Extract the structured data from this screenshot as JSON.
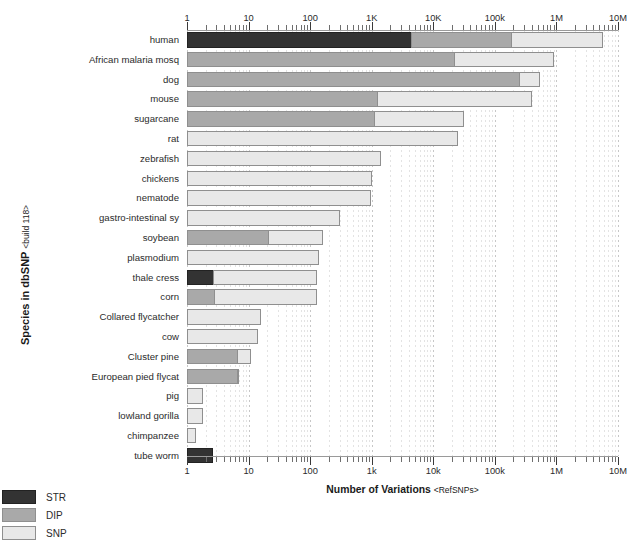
{
  "chart_data": {
    "type": "bar",
    "orientation": "horizontal",
    "stacked": true,
    "log_scale": true,
    "title": "",
    "xlabel": "Number of Variations",
    "xlabel_sub": "<RefSNPs>",
    "ylabel": "Species in dbSNP",
    "ylabel_sub": "<build 118>",
    "xlim": [
      1,
      10000000
    ],
    "grid": true,
    "legend_position": "bottom-left",
    "x_ticks_top": [
      "1",
      "10",
      "100",
      "1K",
      "10K",
      "100k",
      "1M",
      "10M"
    ],
    "x_ticks_bottom": [
      "1",
      "10",
      "100",
      "1k",
      "10k",
      "100k",
      "1M",
      "10M"
    ],
    "x_tick_values": [
      1,
      10,
      100,
      1000,
      10000,
      100000,
      1000000,
      10000000
    ],
    "series": [
      {
        "name": "STR",
        "color": "#333333"
      },
      {
        "name": "DIP",
        "color": "#a9a9a9"
      },
      {
        "name": "SNP",
        "color": "#e8e8e8"
      }
    ],
    "categories": [
      "human",
      "African malaria mosq",
      "dog",
      "mouse",
      "sugarcane",
      "rat",
      "zebrafish",
      "chickens",
      "nematode",
      "gastro-intestinal sy",
      "soybean",
      "plasmodium",
      "thale cress",
      "corn",
      "Collared flycatcher",
      "cow",
      "Cluster pine",
      "European pied flycat",
      "pig",
      "lowland gorilla",
      "chimpanzee",
      "tube worm"
    ],
    "rows": [
      {
        "label": "human",
        "STR": 4400,
        "DIP": 180000,
        "SNP": 5700000,
        "total": 5700000
      },
      {
        "label": "African malaria mosq",
        "STR": 0,
        "DIP": 22000,
        "SNP": 900000,
        "total": 900000
      },
      {
        "label": "dog",
        "STR": 0,
        "DIP": 250000,
        "SNP": 550000,
        "total": 550000
      },
      {
        "label": "mouse",
        "STR": 0,
        "DIP": 1200,
        "SNP": 400000,
        "total": 400000
      },
      {
        "label": "sugarcane",
        "STR": 0,
        "DIP": 1100,
        "SNP": 32000,
        "total": 32000
      },
      {
        "label": "rat",
        "STR": 0,
        "DIP": 0,
        "SNP": 25000,
        "total": 25000
      },
      {
        "label": "zebrafish",
        "STR": 0,
        "DIP": 0,
        "SNP": 1400,
        "total": 1400
      },
      {
        "label": "chickens",
        "STR": 0,
        "DIP": 0,
        "SNP": 1000,
        "total": 1000
      },
      {
        "label": "nematode",
        "STR": 0,
        "DIP": 0,
        "SNP": 970,
        "total": 970
      },
      {
        "label": "gastro-intestinal sy",
        "STR": 0,
        "DIP": 0,
        "SNP": 300,
        "total": 300
      },
      {
        "label": "soybean",
        "STR": 0,
        "DIP": 21,
        "SNP": 160,
        "total": 160
      },
      {
        "label": "plasmodium",
        "STR": 0,
        "DIP": 0,
        "SNP": 140,
        "total": 140
      },
      {
        "label": "thale cress",
        "STR": 2.6,
        "DIP": 0,
        "SNP": 130,
        "total": 130
      },
      {
        "label": "corn",
        "STR": 0,
        "DIP": 2.7,
        "SNP": 130,
        "total": 130
      },
      {
        "label": "Collared flycatcher",
        "STR": 0,
        "DIP": 0,
        "SNP": 16,
        "total": 16
      },
      {
        "label": "cow",
        "STR": 0,
        "DIP": 0,
        "SNP": 14,
        "total": 14
      },
      {
        "label": "Cluster pine",
        "STR": 0,
        "DIP": 6.5,
        "SNP": 11,
        "total": 11
      },
      {
        "label": "European pied flycat",
        "STR": 0,
        "DIP": 6.8,
        "SNP": 7.0,
        "total": 7.0
      },
      {
        "label": "pig",
        "STR": 0,
        "DIP": 0,
        "SNP": 1.8,
        "total": 1.8
      },
      {
        "label": "lowland gorilla",
        "STR": 0,
        "DIP": 0,
        "SNP": 1.8,
        "total": 1.8
      },
      {
        "label": "chimpanzee",
        "STR": 0,
        "DIP": 0,
        "SNP": 1.4,
        "total": 1.4
      },
      {
        "label": "tube worm",
        "STR": 2.6,
        "DIP": 0,
        "SNP": 0,
        "total": 2.6
      }
    ]
  },
  "legend": {
    "items": [
      {
        "label": "STR",
        "color": "#333333"
      },
      {
        "label": "DIP",
        "color": "#a9a9a9"
      },
      {
        "label": "SNP",
        "color": "#e8e8e8"
      }
    ]
  }
}
